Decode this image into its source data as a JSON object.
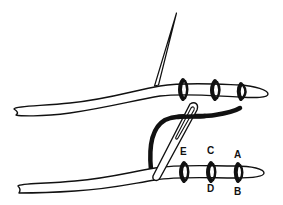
{
  "figure": {
    "type": "line-art illustration",
    "colors": {
      "ink": "#111111",
      "background": "#ffffff",
      "fill": "#ffffff"
    }
  },
  "top_cord": {
    "bindings": 3,
    "needle": "straight needle inserted at left of bindings"
  },
  "bottom_cord": {
    "bindings": 3,
    "needle": "needle with eye threaded by thick black thread"
  },
  "labels": {
    "E": "E",
    "C": "C",
    "A": "A",
    "D": "D",
    "B": "B"
  }
}
